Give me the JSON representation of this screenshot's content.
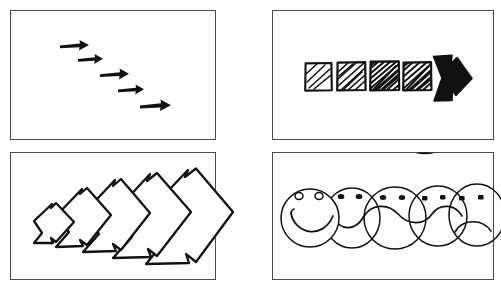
{
  "sheet": {
    "title": "Hand-drawn four-panel progression sketch",
    "background_color": "#ffffff",
    "ink_color": "#111111",
    "frame_color": "#4a4a4a",
    "width": 501,
    "height": 291
  },
  "panels": [
    {
      "id": "panel-top-left",
      "name": "descending-arrows-panel",
      "position": "top-left",
      "frame": {
        "x": 10,
        "y": 10,
        "width": 206,
        "height": 130
      },
      "motif": "five-descending-right-arrows",
      "description": "Five solid black arrows pointing right, stepping down diagonally from upper-left to lower-right",
      "item_count": 5,
      "arrows": [
        {
          "index": 1,
          "x": 60,
          "y": 44,
          "length": 28,
          "label": "arrow-1"
        },
        {
          "index": 2,
          "x": 78,
          "y": 58,
          "length": 24,
          "label": "arrow-2"
        },
        {
          "index": 3,
          "x": 100,
          "y": 73,
          "length": 28,
          "label": "arrow-3"
        },
        {
          "index": 4,
          "x": 118,
          "y": 88,
          "length": 26,
          "label": "arrow-4"
        },
        {
          "index": 5,
          "x": 140,
          "y": 104,
          "length": 30,
          "label": "arrow-5"
        }
      ]
    },
    {
      "id": "panel-top-right",
      "name": "hatched-squares-arrow-panel",
      "position": "top-right",
      "frame": {
        "x": 272,
        "y": 10,
        "width": 222,
        "height": 130
      },
      "motif": "four-hatched-squares-then-solid-arrow",
      "description": "Four hand-drawn squares filled with diagonal hatching of increasing density, followed by a solid black right-pointing arrow",
      "item_count": 5,
      "squares": [
        {
          "index": 1,
          "x": 305,
          "y": 63,
          "size": 27,
          "hatch_lines": 4,
          "density": "light",
          "label": "square-1"
        },
        {
          "index": 2,
          "x": 337,
          "y": 62,
          "size": 29,
          "hatch_lines": 8,
          "density": "medium",
          "label": "square-2"
        },
        {
          "index": 3,
          "x": 370,
          "y": 61,
          "size": 30,
          "hatch_lines": 13,
          "density": "heavy",
          "label": "square-3"
        },
        {
          "index": 4,
          "x": 403,
          "y": 62,
          "size": 29,
          "hatch_lines": 11,
          "density": "heavy",
          "label": "square-4"
        }
      ],
      "arrow": {
        "x": 433,
        "y": 55,
        "width": 40,
        "height": 46,
        "fill": "solid-black",
        "label": "solid-arrow"
      }
    },
    {
      "id": "panel-bottom-left",
      "name": "nested-chevrons-panel",
      "position": "bottom-left",
      "frame": {
        "x": 10,
        "y": 152,
        "width": 206,
        "height": 128
      },
      "motif": "five-growing-chevron-outlines",
      "description": "Five nested chevron arrow outlines pointing right, each larger than the one before, the largest overflowing the panel border",
      "item_count": 5,
      "chevrons": [
        {
          "index": 1,
          "scale": 0.34,
          "x": 34,
          "y": 218,
          "label": "chevron-1"
        },
        {
          "index": 2,
          "scale": 0.52,
          "x": 56,
          "y": 216,
          "label": "chevron-2"
        },
        {
          "index": 3,
          "scale": 0.7,
          "x": 83,
          "y": 214,
          "label": "chevron-3"
        },
        {
          "index": 4,
          "scale": 0.86,
          "x": 113,
          "y": 214,
          "label": "chevron-4"
        },
        {
          "index": 5,
          "scale": 1.0,
          "x": 146,
          "y": 214,
          "label": "chevron-5"
        }
      ]
    },
    {
      "id": "panel-bottom-right",
      "name": "smiley-to-frown-faces-panel",
      "position": "bottom-right",
      "frame": {
        "x": 272,
        "y": 152,
        "width": 222,
        "height": 128
      },
      "motif": "five-overlapping-faces-smile-to-frown",
      "description": "Five overlapping circular faces whose shared mouth line morphs from a broad smile on the left to a deep frown on the right",
      "item_count": 5,
      "mark": {
        "name": "ink-smudge",
        "x": 425,
        "y": 153,
        "width": 18,
        "height": 3
      },
      "faces": [
        {
          "index": 1,
          "cx": 310,
          "cy": 218,
          "rx": 29,
          "ry": 29,
          "eyes": "hollow-circles",
          "mouth": "big-smile",
          "label": "face-happy"
        },
        {
          "index": 2,
          "cx": 352,
          "cy": 218,
          "rx": 28,
          "ry": 30,
          "eyes": "small-dots",
          "mouth": "slight-smile",
          "label": "face-slight-smile"
        },
        {
          "index": 3,
          "cx": 395,
          "cy": 218,
          "rx": 31,
          "ry": 31,
          "eyes": "oval-dots",
          "mouth": "flat",
          "label": "face-neutral"
        },
        {
          "index": 4,
          "cx": 438,
          "cy": 216,
          "rx": 29,
          "ry": 30,
          "eyes": "square-dots",
          "mouth": "slight-frown",
          "label": "face-slight-frown"
        },
        {
          "index": 5,
          "cx": 477,
          "cy": 215,
          "rx": 28,
          "ry": 31,
          "eyes": "square-dots",
          "mouth": "deep-frown",
          "label": "face-sad"
        }
      ]
    }
  ]
}
